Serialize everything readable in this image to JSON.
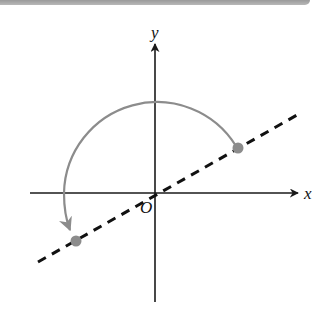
{
  "diagram": {
    "axes": {
      "x_label": "x",
      "y_label": "y",
      "origin_label": "O"
    },
    "colors": {
      "axis": "#1a1a1a",
      "dashed_line": "#111111",
      "arc": "#8c8c8c",
      "points": "#8c8c8c",
      "top_bar": "#a8a8a8"
    },
    "elements": {
      "line": "dashed line through origin",
      "point_start": "point on line in quadrant I",
      "point_end": "point on line in quadrant III",
      "arc": "curved arrow rotating point counterclockwise 180° about origin"
    }
  }
}
